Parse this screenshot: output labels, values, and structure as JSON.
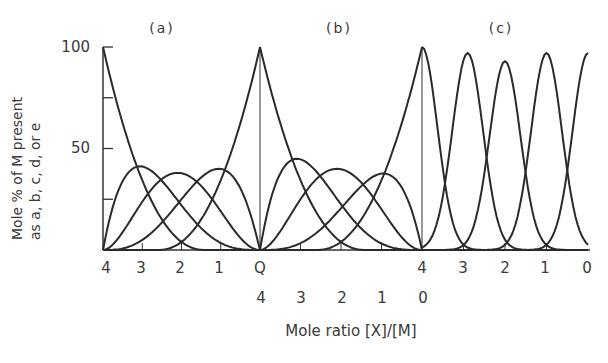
{
  "chart_data": {
    "type": "line",
    "title": "",
    "ylabel": "Mole % of M present as a, b, c, d, or e",
    "xlabel": "Mole ratio [X]/[M]",
    "ylim": [
      0,
      100
    ],
    "yticks": [
      0,
      25,
      50,
      75,
      100
    ],
    "ytick_labels": [
      "",
      "",
      "50",
      "",
      "100"
    ],
    "grid": false,
    "legend": null,
    "panels": [
      {
        "label": "(a)",
        "x_tick_labels": [
          "4",
          "3",
          "2",
          "1",
          "Q"
        ],
        "x_direction": "decreasing",
        "x_range": [
          4,
          0
        ],
        "series": [
          {
            "name": "a",
            "peak_x": 4,
            "peak_y": 100
          },
          {
            "name": "b",
            "peak_x": 3.25,
            "peak_y": 40
          },
          {
            "name": "c",
            "peak_x": 2.1,
            "peak_y": 38
          },
          {
            "name": "d",
            "peak_x": 1.05,
            "peak_y": 40
          },
          {
            "name": "e",
            "peak_x": 0,
            "peak_y": 100
          }
        ]
      },
      {
        "label": "(b)",
        "x_tick_labels": [
          "4",
          "3",
          "2",
          "1",
          "0"
        ],
        "x_direction": "decreasing",
        "x_range": [
          4,
          0
        ],
        "series": [
          {
            "name": "a",
            "peak_x": 4,
            "peak_y": 100
          },
          {
            "name": "b",
            "peak_x": 3.4,
            "peak_y": 41
          },
          {
            "name": "c",
            "peak_x": 2.1,
            "peak_y": 40
          },
          {
            "name": "d",
            "peak_x": 0.8,
            "peak_y": 37
          },
          {
            "name": "e",
            "peak_x": 0,
            "peak_y": 100
          }
        ]
      },
      {
        "label": "(c)",
        "x_tick_labels": [
          "4",
          "3",
          "2",
          "1",
          "0"
        ],
        "x_direction": "decreasing",
        "x_range": [
          4,
          0
        ],
        "series": [
          {
            "name": "a",
            "peak_x": 4,
            "peak_y": 100
          },
          {
            "name": "b",
            "peak_x": 2.9,
            "peak_y": 97
          },
          {
            "name": "c",
            "peak_x": 2.0,
            "peak_y": 93
          },
          {
            "name": "d",
            "peak_x": 1.0,
            "peak_y": 97
          },
          {
            "name": "e",
            "peak_x": 0,
            "peak_y": 97
          }
        ]
      }
    ]
  },
  "labels": {
    "panel_a": "(a)",
    "panel_b": "(b)",
    "panel_c": "(c)",
    "y_axis_line1": "Mole % of M present",
    "y_axis_line2": "as a, b, c, d, or e",
    "y_tick_100": "100",
    "y_tick_50": "50",
    "x_axis_title": "Mole ratio [X]/[M]",
    "row1": [
      "4",
      "3",
      "2",
      "1",
      "Q",
      "4",
      "3",
      "2",
      "1",
      "0"
    ],
    "row2": [
      "4",
      "3",
      "2",
      "1",
      "0"
    ]
  }
}
